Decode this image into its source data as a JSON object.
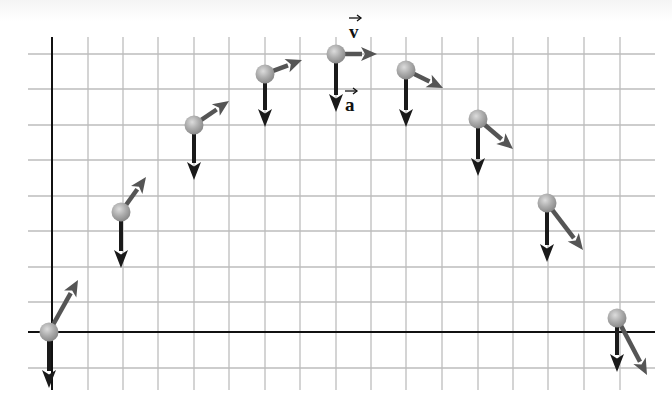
{
  "figure": {
    "labels": {
      "velocity": "v",
      "acceleration": "a"
    },
    "colors": {
      "grid": "#bdbdbd",
      "axis": "#111111",
      "velocity_arrow": "#555555",
      "acceleration_arrow": "#1a1a1a",
      "ball": "#a8a8a8",
      "ball_highlight": "#d8d8d8"
    },
    "axes": {
      "origin_px": [
        49,
        332
      ],
      "y_axis": {
        "x": 52,
        "y_top": 37,
        "y_bottom": 390
      },
      "x_axis": {
        "y": 332,
        "x_left": 28,
        "x_right": 655
      }
    },
    "grid": {
      "x_lines": [
        88,
        123,
        158,
        194,
        229,
        265,
        300,
        336,
        371,
        406,
        442,
        478,
        513,
        548,
        584,
        620
      ],
      "y_lines": [
        54,
        89,
        125,
        160,
        196,
        231,
        267,
        302,
        368
      ],
      "x_range": [
        28,
        655
      ],
      "y_range": [
        37,
        390
      ]
    },
    "positions": [
      {
        "ball": [
          49,
          332
        ],
        "velocity_tip": [
          78,
          280
        ],
        "accel_tip": [
          49,
          388
        ]
      },
      {
        "ball": [
          121,
          212
        ],
        "velocity_tip": [
          146,
          177
        ],
        "accel_tip": [
          121,
          268
        ]
      },
      {
        "ball": [
          194,
          125
        ],
        "velocity_tip": [
          229,
          101
        ],
        "accel_tip": [
          194,
          180
        ]
      },
      {
        "ball": [
          265,
          74
        ],
        "velocity_tip": [
          302,
          60
        ],
        "accel_tip": [
          265,
          127
        ]
      },
      {
        "ball": [
          336,
          54
        ],
        "velocity_tip": [
          377,
          54
        ],
        "accel_tip": [
          336,
          112
        ]
      },
      {
        "ball": [
          406,
          70
        ],
        "velocity_tip": [
          443,
          88
        ],
        "accel_tip": [
          406,
          127
        ]
      },
      {
        "ball": [
          478,
          119
        ],
        "velocity_tip": [
          513,
          149
        ],
        "accel_tip": [
          478,
          176
        ]
      },
      {
        "ball": [
          547,
          203
        ],
        "velocity_tip": [
          583,
          250
        ],
        "accel_tip": [
          547,
          262
        ]
      },
      {
        "ball": [
          617,
          318
        ],
        "velocity_tip": [
          647,
          375
        ],
        "accel_tip": [
          617,
          372
        ]
      }
    ],
    "label_positions": {
      "velocity": [
        349,
        22
      ],
      "acceleration": [
        345,
        95
      ]
    }
  }
}
